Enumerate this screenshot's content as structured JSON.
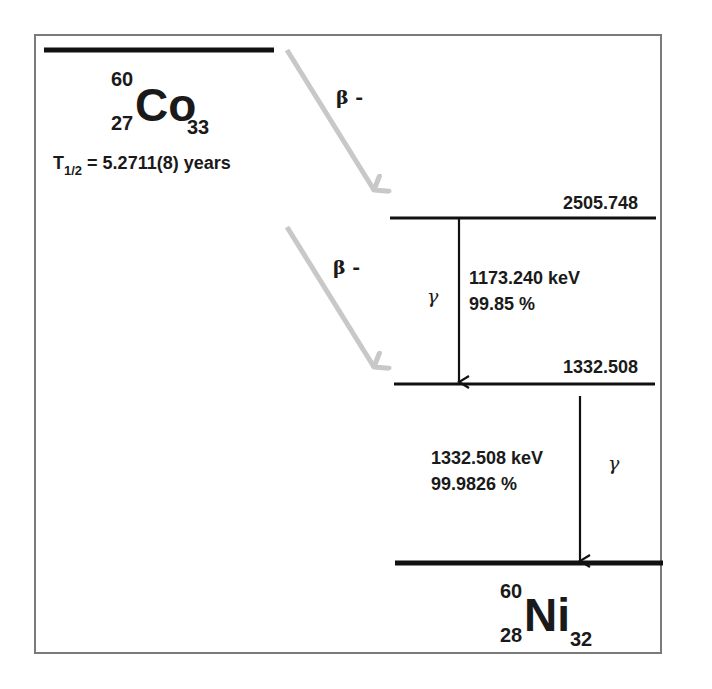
{
  "parent": {
    "symbol": "Co",
    "mass_number": "60",
    "atomic_number": "27",
    "neutron_number": "33",
    "half_life_label": "T",
    "half_life_sub": "1/2",
    "half_life_value": "= 5.2711(8) years"
  },
  "daughter": {
    "symbol": "Ni",
    "mass_number": "60",
    "atomic_number": "28",
    "neutron_number": "32"
  },
  "decays": [
    {
      "type": "β -",
      "to_level": "2505.748"
    },
    {
      "type": "β -",
      "to_level": "1332.508"
    }
  ],
  "levels": [
    {
      "energy": "2505.748"
    },
    {
      "energy": "1332.508"
    },
    {
      "energy": "0"
    }
  ],
  "transitions": [
    {
      "symbol": "γ",
      "energy": "1173.240 keV",
      "intensity": "99.85 %",
      "from": "2505.748",
      "to": "1332.508"
    },
    {
      "symbol": "γ",
      "energy": "1332.508 keV",
      "intensity": "99.9826 %",
      "from": "1332.508",
      "to": "0"
    }
  ],
  "colors": {
    "frame": "#7a7a7a",
    "level_line": "#111111",
    "beta_arrow": "#c8c8c8",
    "text": "#1a1a1a"
  }
}
